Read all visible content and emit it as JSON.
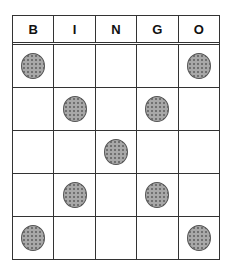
{
  "header": {
    "letters": [
      "B",
      "I",
      "N",
      "G",
      "O"
    ]
  },
  "grid": [
    [
      true,
      false,
      false,
      false,
      true
    ],
    [
      false,
      true,
      false,
      true,
      false
    ],
    [
      false,
      false,
      true,
      false,
      false
    ],
    [
      false,
      true,
      false,
      true,
      false
    ],
    [
      true,
      false,
      false,
      false,
      true
    ]
  ],
  "colors": {
    "chip": "#a8a8a8",
    "line": "#333333"
  }
}
